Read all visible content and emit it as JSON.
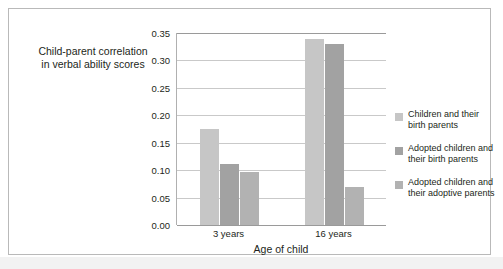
{
  "chart_data": {
    "type": "bar",
    "title": "",
    "xlabel": "Age of child",
    "ylabel_line1": "Child-parent correlation",
    "ylabel_line2": "in verbal ability scores",
    "categories": [
      "3 years",
      "16 years"
    ],
    "ylim": [
      0.0,
      0.35
    ],
    "ytick_labels": [
      "0.35",
      "0.30",
      "0.25",
      "0.20",
      "0.15",
      "0.10",
      "0.05",
      "0.00"
    ],
    "ytick_values": [
      0.35,
      0.3,
      0.25,
      0.2,
      0.15,
      0.1,
      0.05,
      0.0
    ],
    "grid": true,
    "legend_position": "right",
    "series": [
      {
        "name_line1": "Children and their",
        "name_line2": "birth parents",
        "color": "#c6c6c6",
        "values": [
          0.175,
          0.34
        ]
      },
      {
        "name_line1": "Adopted children and",
        "name_line2": "their birth parents",
        "color": "#a2a2a2",
        "values": [
          0.112,
          0.33
        ]
      },
      {
        "name_line1": "Adopted children and",
        "name_line2": "their adoptive parents",
        "color": "#b2b2b2",
        "values": [
          0.097,
          0.07
        ]
      }
    ]
  },
  "frame": {
    "border_color": "#b9b9b9",
    "background": "#ffffff"
  }
}
